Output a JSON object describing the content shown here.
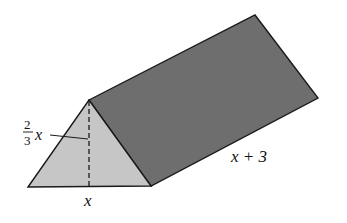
{
  "figure": {
    "type": "triangular-prism",
    "labels": {
      "height_num": "2",
      "height_den": "3",
      "height_var": "x",
      "base": "x",
      "length": "x + 3"
    },
    "colors": {
      "front_face": "#c6c6c6",
      "side_face": "#6e6e6e",
      "edge": "#1a1a1a",
      "background": "#ffffff"
    }
  }
}
